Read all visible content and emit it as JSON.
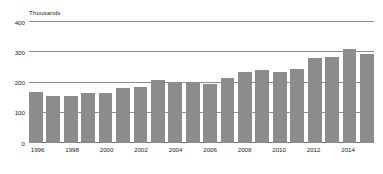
{
  "chart_data": {
    "type": "bar",
    "title": "",
    "subtitle": "",
    "unit_label": "Thousands",
    "xlabel": "",
    "ylabel": "Thousands",
    "ylim": [
      0,
      400
    ],
    "yticks": [
      0,
      100,
      200,
      300,
      400
    ],
    "ytick_labels": [
      "0",
      "100",
      "200",
      "300",
      "400"
    ],
    "grid": true,
    "legend": null,
    "bar_color": "#8c8c8c",
    "gridline_color": "#8d8d8d",
    "text_color": "#231f20",
    "categories": [
      "1996",
      "1997",
      "1998",
      "1999",
      "2000",
      "2001",
      "2002",
      "2003",
      "2004",
      "2005",
      "2006",
      "2007",
      "2008",
      "2009",
      "2010",
      "2011",
      "2012",
      "2013",
      "2014",
      "2015"
    ],
    "xtick_labels": [
      "1996",
      "1998",
      "2000",
      "2002",
      "2004",
      "2006",
      "2008",
      "2010",
      "2012",
      "2014"
    ],
    "values": [
      168,
      157,
      157,
      165,
      165,
      181,
      184,
      208,
      200,
      198,
      196,
      214,
      236,
      241,
      235,
      246,
      282,
      286,
      310,
      295
    ],
    "series": [
      {
        "name": "",
        "values": [
          168,
          157,
          157,
          165,
          165,
          181,
          184,
          208,
          200,
          198,
          196,
          214,
          236,
          241,
          235,
          246,
          282,
          286,
          310,
          295
        ]
      }
    ]
  }
}
